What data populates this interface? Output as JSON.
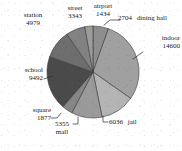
{
  "chart_data": {
    "type": "pie",
    "title": "",
    "labels": [
      "dining hall",
      "indoor",
      "jail",
      "mall",
      "square",
      "school",
      "station",
      "street",
      "airport"
    ],
    "values": [
      2704,
      14600,
      6036,
      5355,
      1877,
      9492,
      4979,
      3343,
      1434
    ],
    "total": 49820,
    "legend": "none",
    "grid": false,
    "start_angle_deg": 90,
    "direction": "clockwise",
    "slices": [
      {
        "label": "dining hall",
        "value": 2704,
        "value_text": "2704",
        "color": "#8e8e8e",
        "angle_deg": 19.5
      },
      {
        "label": "indoor",
        "value": 14600,
        "value_text": "14600",
        "color": "#a0a0a0",
        "angle_deg": 105.5
      },
      {
        "label": "jail",
        "value": 6036,
        "value_text": "6036",
        "color": "#b4b4b4",
        "angle_deg": 43.6
      },
      {
        "label": "mall",
        "value": 5355,
        "value_text": "5355",
        "color": "#9a9a9a",
        "angle_deg": 38.7
      },
      {
        "label": "square",
        "value": 1877,
        "value_text": "1877",
        "color": "#868686",
        "angle_deg": 13.6
      },
      {
        "label": "school",
        "value": 9492,
        "value_text": "9492",
        "color": "#4a4a4a",
        "angle_deg": 68.6
      },
      {
        "label": "station",
        "value": 4979,
        "value_text": "4979",
        "color": "#6e6e6e",
        "angle_deg": 36.0
      },
      {
        "label": "street",
        "value": 3343,
        "value_text": "3343",
        "color": "#828282",
        "angle_deg": 24.2
      },
      {
        "label": "airport",
        "value": 1434,
        "value_text": "1434",
        "color": "#9c9c9c",
        "angle_deg": 10.4
      }
    ]
  },
  "labels": {
    "station": {
      "name": "station",
      "value": "4979"
    },
    "street": {
      "name": "street",
      "value": "3343"
    },
    "airport": {
      "name": "airport",
      "value": "1434"
    },
    "dining_hall": {
      "name": "dining hall",
      "value": "2704"
    },
    "indoor": {
      "name": "indoor",
      "value": "14600"
    },
    "jail": {
      "name": "jail",
      "value": "6036"
    },
    "mall": {
      "name": "mall",
      "value": "5355"
    },
    "square": {
      "name": "square",
      "value": "1877"
    },
    "school": {
      "name": "school",
      "value": "9492"
    }
  }
}
